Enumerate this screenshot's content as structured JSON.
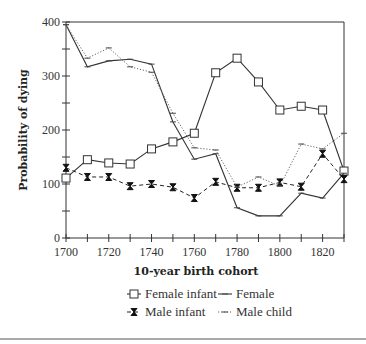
{
  "chart_data": {
    "type": "line",
    "title": "",
    "xlabel": "10-year birth cohort",
    "ylabel": "Probability of dying",
    "x": [
      1700,
      1710,
      1720,
      1730,
      1740,
      1750,
      1760,
      1770,
      1780,
      1790,
      1800,
      1810,
      1820,
      1830
    ],
    "xticks": [
      1700,
      1720,
      1740,
      1760,
      1780,
      1800,
      1820
    ],
    "yticks": [
      0,
      100,
      200,
      300,
      400
    ],
    "xlim": [
      1700,
      1830
    ],
    "ylim": [
      0,
      400
    ],
    "grid": false,
    "legend_position": "bottom",
    "series": [
      {
        "name": "Female infant",
        "marker": "square",
        "line": "solid",
        "values": [
          111,
          145,
          139,
          137,
          165,
          178,
          194,
          306,
          333,
          289,
          237,
          244,
          237,
          124
        ]
      },
      {
        "name": "Female",
        "marker": "dash",
        "line": "solid",
        "values": [
          395,
          317,
          328,
          331,
          322,
          215,
          146,
          156,
          56,
          41,
          41,
          83,
          74,
          120
        ]
      },
      {
        "name": "Male infant",
        "marker": "hourglass",
        "line": "dashed",
        "values": [
          130,
          113,
          113,
          96,
          100,
          94,
          74,
          104,
          93,
          93,
          103,
          95,
          156,
          109
        ]
      },
      {
        "name": "Male child",
        "marker": "dash",
        "line": "dotted",
        "values": [
          395,
          333,
          352,
          317,
          307,
          231,
          167,
          163,
          94,
          113,
          96,
          174,
          165,
          194
        ]
      }
    ]
  },
  "legend": {
    "items": [
      "Female infant",
      "Female",
      "Male infant",
      "Male child"
    ]
  }
}
